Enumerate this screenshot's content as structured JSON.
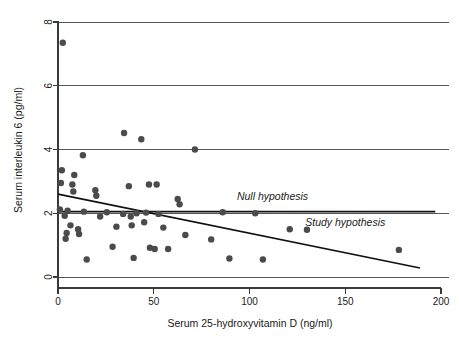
{
  "chart_data": {
    "type": "scatter",
    "title": "",
    "xlabel": "Serum 25-hydroxyvitamin D (ng/ml)",
    "ylabel": "Serum interleukin 6 (pg/ml)",
    "xlim": [
      0,
      200
    ],
    "ylim": [
      0,
      8
    ],
    "xticks": [
      0,
      50,
      100,
      150,
      200
    ],
    "yticks": [
      0,
      2,
      4,
      6,
      8
    ],
    "xtick_labels": [
      "0",
      "50",
      "100",
      "150",
      "200"
    ],
    "ytick_labels": [
      "0",
      "2",
      "4",
      "6",
      "8"
    ],
    "grid": "horizontal",
    "legend": "none",
    "point_color": "#4b4b4b",
    "line_color": "#111111",
    "grid_color": "#555555",
    "points": [
      {
        "x": 2.5,
        "y": 7.35
      },
      {
        "x": 34.5,
        "y": 4.52
      },
      {
        "x": 43.5,
        "y": 4.32
      },
      {
        "x": 71.5,
        "y": 4.0
      },
      {
        "x": 13.0,
        "y": 3.82
      },
      {
        "x": 2.0,
        "y": 3.35
      },
      {
        "x": 8.5,
        "y": 3.2
      },
      {
        "x": 1.5,
        "y": 2.95
      },
      {
        "x": 7.5,
        "y": 2.9
      },
      {
        "x": 8.0,
        "y": 2.68
      },
      {
        "x": 19.5,
        "y": 2.72
      },
      {
        "x": 20.0,
        "y": 2.55
      },
      {
        "x": 37.0,
        "y": 2.85
      },
      {
        "x": 47.5,
        "y": 2.9
      },
      {
        "x": 51.5,
        "y": 2.9
      },
      {
        "x": 1.0,
        "y": 2.12
      },
      {
        "x": 5.0,
        "y": 2.08
      },
      {
        "x": 62.5,
        "y": 2.45
      },
      {
        "x": 63.5,
        "y": 2.28
      },
      {
        "x": 3.5,
        "y": 1.92
      },
      {
        "x": 13.5,
        "y": 2.05
      },
      {
        "x": 25.5,
        "y": 2.03
      },
      {
        "x": 86.0,
        "y": 2.03
      },
      {
        "x": 103.0,
        "y": 2.0
      },
      {
        "x": 34.0,
        "y": 1.98
      },
      {
        "x": 41.0,
        "y": 2.0
      },
      {
        "x": 46.0,
        "y": 2.02
      },
      {
        "x": 52.5,
        "y": 1.98
      },
      {
        "x": 6.5,
        "y": 1.62
      },
      {
        "x": 10.5,
        "y": 1.5
      },
      {
        "x": 11.0,
        "y": 1.35
      },
      {
        "x": 4.5,
        "y": 1.38
      },
      {
        "x": 4.0,
        "y": 1.2
      },
      {
        "x": 22.0,
        "y": 1.9
      },
      {
        "x": 30.5,
        "y": 1.58
      },
      {
        "x": 38.0,
        "y": 1.9
      },
      {
        "x": 38.5,
        "y": 1.62
      },
      {
        "x": 45.0,
        "y": 1.72
      },
      {
        "x": 55.0,
        "y": 1.55
      },
      {
        "x": 66.5,
        "y": 1.32
      },
      {
        "x": 80.0,
        "y": 1.18
      },
      {
        "x": 28.5,
        "y": 0.95
      },
      {
        "x": 48.0,
        "y": 0.92
      },
      {
        "x": 50.5,
        "y": 0.88
      },
      {
        "x": 57.5,
        "y": 0.88
      },
      {
        "x": 39.5,
        "y": 0.6
      },
      {
        "x": 15.0,
        "y": 0.55
      },
      {
        "x": 89.5,
        "y": 0.58
      },
      {
        "x": 107.0,
        "y": 0.55
      },
      {
        "x": 121.0,
        "y": 1.5
      },
      {
        "x": 130.0,
        "y": 1.48
      },
      {
        "x": 178.0,
        "y": 0.85
      }
    ],
    "lines": [
      {
        "name": "Null hypothesis",
        "label": "Null hypothesis",
        "x0": 0,
        "y0": 2.05,
        "x1": 197.0,
        "y1": 2.05,
        "label_x": 112.0,
        "label_y": 2.42
      },
      {
        "name": "Study hypothesis",
        "label": "Study hypothesis",
        "x0": 0,
        "y0": 2.6,
        "x1": 189.0,
        "y1": 0.28,
        "label_x": 150.0,
        "label_y": 1.6
      }
    ]
  }
}
